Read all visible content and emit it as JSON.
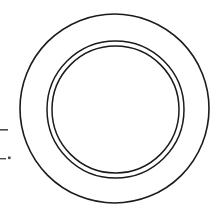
{
  "document": {
    "title": "Plate Line Drawing",
    "background_color": "#ffffff",
    "stroke_color": "#1b1b1b",
    "mark_color": "#4a4a4a",
    "width": 218,
    "height": 219
  },
  "drawing": {
    "subject": "plate-top-view",
    "description": "Top-down outline drawing of a round plate: a single outer rim circle and a pair of closely spaced concentric circles defining the inner well.",
    "center": {
      "cx": 114.5,
      "cy": 108.5
    },
    "shapes": [
      {
        "name": "outer-rim-circle",
        "type": "circle",
        "cx": 114.5,
        "cy": 108.5,
        "r": 94.5,
        "stroke_width": 1.6
      },
      {
        "name": "inner-well-circle-outer",
        "type": "circle",
        "cx": 115.5,
        "cy": 109.5,
        "r": 68.5,
        "stroke_width": 1.5
      },
      {
        "name": "inner-well-circle-inner",
        "type": "circle",
        "cx": 115.5,
        "cy": 109.5,
        "r": 63.5,
        "stroke_width": 1.5
      }
    ],
    "annotations": [
      {
        "name": "left-edge-dash-upper",
        "type": "dash",
        "x": 0,
        "y": 129,
        "width": 8,
        "height": 1.6
      },
      {
        "name": "left-edge-dash-lower",
        "type": "dash",
        "x": 0,
        "y": 158,
        "width": 6,
        "height": 1.4
      },
      {
        "name": "left-edge-dot",
        "type": "dot",
        "x": 8,
        "y": 156.5,
        "width": 2.6,
        "height": 2.6
      }
    ]
  }
}
